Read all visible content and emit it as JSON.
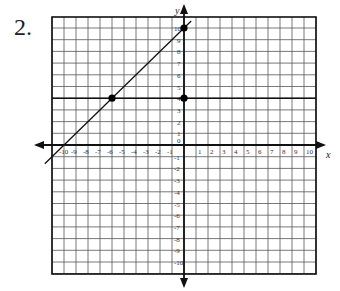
{
  "problem": {
    "number": "2."
  },
  "graph": {
    "x_axis_label": "x",
    "y_axis_label": "y",
    "x_range": [
      -11,
      11
    ],
    "y_range": [
      -11,
      11
    ],
    "x_tick_labels": [
      "-10",
      "-9",
      "-8",
      "-7",
      "-6",
      "-5",
      "-4",
      "-3",
      "-2",
      "-1",
      "1",
      "2",
      "3",
      "4",
      "5",
      "6",
      "7",
      "8",
      "9",
      "10"
    ],
    "y_tick_labels": [
      "10",
      "9",
      "8",
      "7",
      "6",
      "5",
      "4",
      "3",
      "2",
      "1",
      "0",
      "-1",
      "-2",
      "-3",
      "-4",
      "-5",
      "-6",
      "-7",
      "-8",
      "-9",
      "-10"
    ],
    "points": [
      {
        "x": -6,
        "y": 4
      },
      {
        "x": 0,
        "y": 4
      },
      {
        "x": 0,
        "y": 10
      }
    ],
    "lines": [
      {
        "description": "diagonal line through (-6,4) and (0,10)",
        "slope": 1,
        "intercept": 10
      },
      {
        "description": "horizontal line",
        "y": 4
      }
    ],
    "colors": {
      "grid": "#555555",
      "axis": "#111111",
      "line": "#111111"
    }
  }
}
